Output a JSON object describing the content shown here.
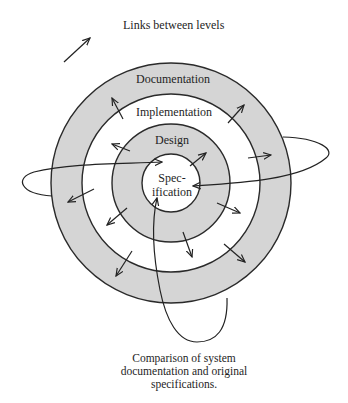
{
  "legend": {
    "arrow_label": "Links between levels"
  },
  "rings": [
    {
      "label": "Documentation",
      "fill": "#d5d5d5"
    },
    {
      "label": "Implementation",
      "fill": "#ffffff"
    },
    {
      "label": "Design",
      "fill": "#d5d5d5"
    },
    {
      "label_line1": "Spec-",
      "label_line2": "ification",
      "fill": "#ffffff"
    }
  ],
  "caption": {
    "line1": "Comparison of system",
    "line2": "documentation and original",
    "line3": "specifications."
  },
  "colors": {
    "ink": "#222222",
    "shaded_ring": "#d5d5d5",
    "background": "#ffffff"
  }
}
